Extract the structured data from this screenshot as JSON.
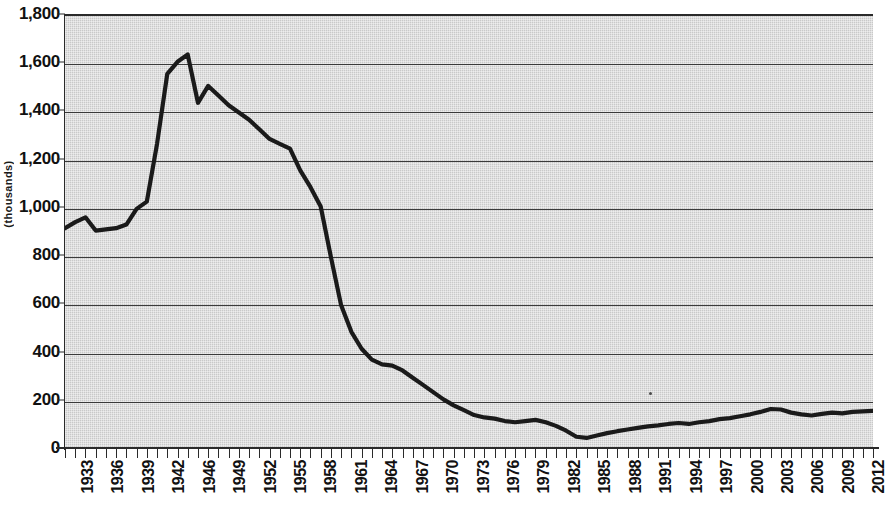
{
  "chart_data": {
    "type": "line",
    "title": "",
    "subtitle": "",
    "xlabel": "",
    "ylabel": "",
    "ylim": [
      0,
      1800
    ],
    "xlim": [
      1933,
      2012
    ],
    "grid": true,
    "legend": false,
    "legend_position": "none",
    "y_ticks": [
      0,
      200,
      400,
      600,
      800,
      1000,
      1200,
      1400,
      1600,
      1800
    ],
    "y_tick_labels": [
      "0",
      "200",
      "400",
      "600",
      "800",
      "1,000",
      "1,200",
      "1,400",
      "1,600",
      "1,800"
    ],
    "x_tick_labels": [
      "1933",
      "1936",
      "1939",
      "1942",
      "1946",
      "1949",
      "1952",
      "1955",
      "1958",
      "1961",
      "1964",
      "1967",
      "1970",
      "1973",
      "1976",
      "1979",
      "1982",
      "1985",
      "1988",
      "1991",
      "1994",
      "1997",
      "2000",
      "2003",
      "2006",
      "2009",
      "2012"
    ],
    "series": [
      {
        "name": "value",
        "color": "#1a1a1a",
        "x": [
          1933,
          1934,
          1935,
          1936,
          1937,
          1938,
          1939,
          1940,
          1941,
          1942,
          1943,
          1944,
          1945,
          1946,
          1947,
          1948,
          1949,
          1950,
          1951,
          1952,
          1953,
          1954,
          1955,
          1956,
          1957,
          1958,
          1959,
          1960,
          1961,
          1962,
          1963,
          1964,
          1965,
          1966,
          1967,
          1968,
          1969,
          1970,
          1971,
          1972,
          1973,
          1974,
          1975,
          1976,
          1977,
          1978,
          1979,
          1980,
          1981,
          1982,
          1983,
          1984,
          1985,
          1986,
          1987,
          1988,
          1989,
          1990,
          1991,
          1992,
          1993,
          1994,
          1995,
          1996,
          1997,
          1998,
          1999,
          2000,
          2001,
          2002,
          2003,
          2004,
          2005,
          2006,
          2007,
          2008,
          2009,
          2010,
          2011,
          2012
        ],
        "values": [
          920,
          945,
          965,
          910,
          915,
          920,
          935,
          1000,
          1030,
          1270,
          1560,
          1610,
          1640,
          1440,
          1510,
          1470,
          1430,
          1400,
          1370,
          1330,
          1290,
          1270,
          1250,
          1160,
          1090,
          1010,
          800,
          600,
          490,
          420,
          375,
          355,
          350,
          330,
          300,
          270,
          240,
          210,
          185,
          165,
          145,
          135,
          130,
          120,
          115,
          120,
          125,
          115,
          100,
          80,
          55,
          50,
          60,
          70,
          78,
          85,
          92,
          98,
          102,
          108,
          112,
          108,
          115,
          120,
          128,
          132,
          140,
          148,
          158,
          170,
          168,
          155,
          148,
          143,
          150,
          155,
          152,
          158,
          160,
          162
        ]
      }
    ]
  },
  "axis": {
    "vertical_title": "(thousands)"
  },
  "marks": {
    "speck": "dust-speck"
  }
}
